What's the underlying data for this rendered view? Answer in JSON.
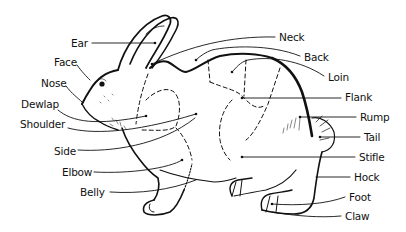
{
  "diagram": {
    "colors": {
      "ink": "#111111",
      "background": "#ffffff"
    },
    "labels": [
      {
        "id": "ear",
        "text": "Ear",
        "x": 71,
        "y": 38,
        "anchor": "end-right"
      },
      {
        "id": "face",
        "text": "Face",
        "x": 54,
        "y": 61
      },
      {
        "id": "nose",
        "text": "Nose",
        "x": 41,
        "y": 81
      },
      {
        "id": "dewlap",
        "text": "Dewlap",
        "x": 21,
        "y": 103
      },
      {
        "id": "shoulder",
        "text": "Shoulder",
        "x": 20,
        "y": 123
      },
      {
        "id": "side",
        "text": "Side",
        "x": 54,
        "y": 145
      },
      {
        "id": "elbow",
        "text": "Elbow",
        "x": 62,
        "y": 166
      },
      {
        "id": "belly",
        "text": "Belly",
        "x": 80,
        "y": 187
      },
      {
        "id": "neck",
        "text": "Neck",
        "x": 279,
        "y": 32
      },
      {
        "id": "back",
        "text": "Back",
        "x": 304,
        "y": 52
      },
      {
        "id": "loin",
        "text": "Loin",
        "x": 328,
        "y": 72
      },
      {
        "id": "flank",
        "text": "Flank",
        "x": 345,
        "y": 92
      },
      {
        "id": "rump",
        "text": "Rump",
        "x": 360,
        "y": 113
      },
      {
        "id": "tail",
        "text": "Tail",
        "x": 364,
        "y": 132
      },
      {
        "id": "stifle",
        "text": "Stifle",
        "x": 359,
        "y": 152
      },
      {
        "id": "hock",
        "text": "Hock",
        "x": 354,
        "y": 172
      },
      {
        "id": "foot",
        "text": "Foot",
        "x": 349,
        "y": 193
      },
      {
        "id": "claw",
        "text": "Claw",
        "x": 345,
        "y": 212
      }
    ]
  }
}
